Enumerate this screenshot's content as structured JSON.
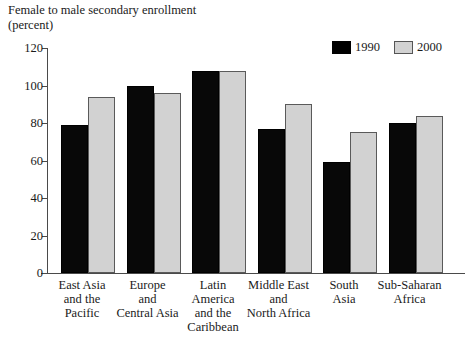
{
  "chart_data": {
    "type": "bar",
    "title": "Female to male secondary enrollment\n(percent)",
    "title_line1": "Female to male secondary enrollment",
    "title_line2": "(percent)",
    "xlabel": "",
    "ylabel": "",
    "ylim": [
      0,
      120
    ],
    "yticks": [
      0,
      20,
      40,
      60,
      80,
      100,
      120
    ],
    "ytick_labels": [
      "0",
      "20",
      "40",
      "60",
      "80",
      "100",
      "120"
    ],
    "grid": false,
    "legend_position": "top-right",
    "categories": [
      "East Asia\nand the\nPacific",
      "Europe\nand\nCentral Asia",
      "Latin\nAmerica\nand the\nCaribbean",
      "Middle East\nand\nNorth Africa",
      "South\nAsia",
      "Sub-Saharan\nAfrica"
    ],
    "series": [
      {
        "name": "1990",
        "color": "#000000",
        "values": [
          79,
          100,
          108,
          77,
          59,
          80
        ]
      },
      {
        "name": "2000",
        "color": "#d2d2d2",
        "values": [
          94,
          96,
          108,
          90,
          75,
          84
        ]
      }
    ]
  },
  "legend": {
    "entries": [
      {
        "label": "1990",
        "swatch": "black-swatch"
      },
      {
        "label": "2000",
        "swatch": "gray-swatch"
      }
    ]
  }
}
